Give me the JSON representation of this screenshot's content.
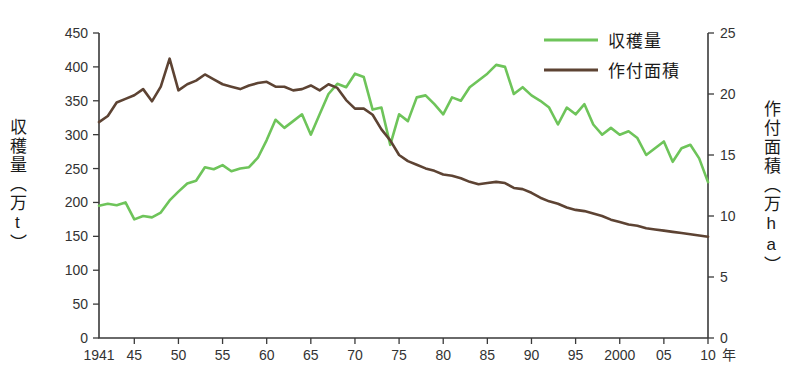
{
  "chart_data": {
    "type": "line",
    "title": "",
    "subtitle": "",
    "xlabel": "年",
    "x_unit_label": "年",
    "ylabel_left": "収穫量（万t）",
    "ylabel_right": "作付面積（万ha）",
    "ylabel_left_chars": "収穫量（万t）",
    "ylabel_right_chars": "作付面積（万ha）",
    "grid": false,
    "legend_position": "top-right",
    "xlim": [
      1941,
      2010
    ],
    "ylim_left": [
      0,
      450
    ],
    "ylim_right": [
      0,
      25
    ],
    "x_tick_labels": [
      "1941",
      "45",
      "50",
      "55",
      "60",
      "65",
      "70",
      "75",
      "80",
      "85",
      "90",
      "95",
      "2000",
      "05",
      "10"
    ],
    "x_tick_values": [
      1941,
      1945,
      1950,
      1955,
      1960,
      1965,
      1970,
      1975,
      1980,
      1985,
      1990,
      1995,
      2000,
      2005,
      2010
    ],
    "y_tick_labels_left": [
      "450",
      "400",
      "350",
      "300",
      "250",
      "200",
      "150",
      "100",
      "50",
      "0"
    ],
    "y_tick_values_left": [
      450,
      400,
      350,
      300,
      250,
      200,
      150,
      100,
      50,
      0
    ],
    "y_tick_labels_right": [
      "25",
      "20",
      "15",
      "10",
      "5",
      "0"
    ],
    "y_tick_values_right": [
      25,
      20,
      15,
      10,
      5,
      0
    ],
    "colors": {
      "harvest": "#6ec45a",
      "area": "#5d4333",
      "axis": "#3a3a3a",
      "text": "#1a1a1a",
      "background": "#ffffff"
    },
    "years": [
      1941,
      1942,
      1943,
      1944,
      1945,
      1946,
      1947,
      1948,
      1949,
      1950,
      1951,
      1952,
      1953,
      1954,
      1955,
      1956,
      1957,
      1958,
      1959,
      1960,
      1961,
      1962,
      1963,
      1964,
      1965,
      1966,
      1967,
      1968,
      1969,
      1970,
      1971,
      1972,
      1973,
      1974,
      1975,
      1976,
      1977,
      1978,
      1979,
      1980,
      1981,
      1982,
      1983,
      1984,
      1985,
      1986,
      1987,
      1988,
      1989,
      1990,
      1991,
      1992,
      1993,
      1994,
      1995,
      1996,
      1997,
      1998,
      1999,
      2000,
      2001,
      2002,
      2003,
      2004,
      2005,
      2006,
      2007,
      2008,
      2009,
      2010
    ],
    "series": [
      {
        "name": "収穫量",
        "axis": "left",
        "unit": "万t",
        "color": "#6ec45a",
        "values": [
          195,
          198,
          196,
          200,
          175,
          180,
          178,
          185,
          203,
          216,
          228,
          232,
          252,
          249,
          255,
          246,
          250,
          252,
          266,
          292,
          322,
          310,
          320,
          330,
          300,
          330,
          360,
          375,
          370,
          390,
          385,
          337,
          340,
          285,
          330,
          320,
          355,
          358,
          345,
          330,
          355,
          350,
          370,
          380,
          390,
          403,
          400,
          360,
          370,
          358,
          350,
          340,
          315,
          340,
          330,
          345,
          315,
          300,
          310,
          300,
          305,
          295,
          270,
          280,
          290,
          260,
          280,
          285,
          265,
          230
        ]
      },
      {
        "name": "作付面積",
        "axis": "right",
        "unit": "万ha",
        "color": "#5d4333",
        "values": [
          17.7,
          18.2,
          19.3,
          19.6,
          19.9,
          20.4,
          19.4,
          20.6,
          22.9,
          20.3,
          20.8,
          21.1,
          21.6,
          21.2,
          20.8,
          20.6,
          20.4,
          20.7,
          20.9,
          21.0,
          20.6,
          20.6,
          20.3,
          20.4,
          20.7,
          20.3,
          20.8,
          20.5,
          19.5,
          18.8,
          18.8,
          18.3,
          17.1,
          16.2,
          15.0,
          14.5,
          14.2,
          13.9,
          13.7,
          13.4,
          13.3,
          13.1,
          12.8,
          12.6,
          12.7,
          12.8,
          12.7,
          12.3,
          12.2,
          11.9,
          11.5,
          11.2,
          11.0,
          10.7,
          10.5,
          10.4,
          10.2,
          10.0,
          9.7,
          9.5,
          9.3,
          9.2,
          9.0,
          8.9,
          8.8,
          8.7,
          8.6,
          8.5,
          8.4,
          8.3
        ]
      }
    ]
  },
  "legend": {
    "items": [
      {
        "label": "収穫量",
        "color": "#6ec45a"
      },
      {
        "label": "作付面積",
        "color": "#5d4333"
      }
    ]
  },
  "axes": {
    "left_title": "収穫量（万t）",
    "right_title": "作付面積（万ha）",
    "x_unit": "年"
  }
}
